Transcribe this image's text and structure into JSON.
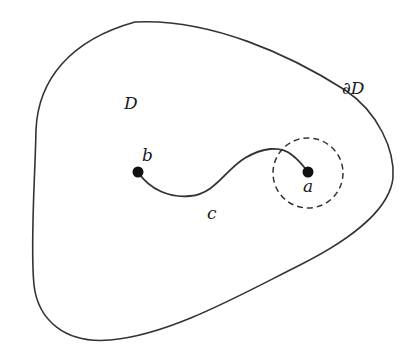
{
  "diagram": {
    "region_label": "D",
    "boundary_label": "∂D",
    "curve_label": "c",
    "points": [
      {
        "label": "b",
        "x": 138,
        "y": 172
      },
      {
        "label": "a",
        "x": 308,
        "y": 172
      }
    ],
    "neighborhood": {
      "center_point": "a",
      "style": "dashed circle"
    },
    "colors": {
      "stroke": "#333333",
      "background": "#ffffff"
    }
  }
}
